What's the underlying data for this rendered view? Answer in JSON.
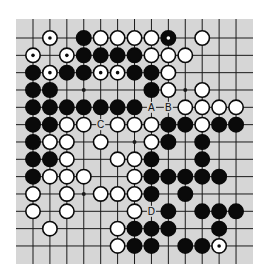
{
  "diagram": {
    "type": "go-board-partial",
    "columns": 13,
    "rows": 13,
    "colors": {
      "board": "#d6d6d6",
      "grid": "#1a1a1a",
      "black_stone": "#0a0a0a",
      "white_stone": "#ffffff",
      "stone_outline": "#0a0a0a"
    },
    "hoshi": [
      {
        "row": 3,
        "col": 3
      },
      {
        "row": 3,
        "col": 9
      },
      {
        "row": 6,
        "col": 6
      },
      {
        "row": 9,
        "col": 3
      }
    ],
    "stones": [
      {
        "row": 0,
        "col": 1,
        "color": "white",
        "marked": true
      },
      {
        "row": 0,
        "col": 3,
        "color": "black"
      },
      {
        "row": 0,
        "col": 4,
        "color": "white"
      },
      {
        "row": 0,
        "col": 5,
        "color": "white"
      },
      {
        "row": 0,
        "col": 6,
        "color": "white"
      },
      {
        "row": 0,
        "col": 7,
        "color": "white"
      },
      {
        "row": 0,
        "col": 8,
        "color": "black",
        "marked": true
      },
      {
        "row": 0,
        "col": 10,
        "color": "white"
      },
      {
        "row": 1,
        "col": 0,
        "color": "white",
        "marked": true
      },
      {
        "row": 1,
        "col": 2,
        "color": "white",
        "marked": true
      },
      {
        "row": 1,
        "col": 3,
        "color": "black"
      },
      {
        "row": 1,
        "col": 4,
        "color": "black"
      },
      {
        "row": 1,
        "col": 5,
        "color": "black"
      },
      {
        "row": 1,
        "col": 6,
        "color": "black"
      },
      {
        "row": 1,
        "col": 7,
        "color": "white"
      },
      {
        "row": 1,
        "col": 8,
        "color": "white"
      },
      {
        "row": 1,
        "col": 9,
        "color": "white"
      },
      {
        "row": 2,
        "col": 0,
        "color": "black"
      },
      {
        "row": 2,
        "col": 1,
        "color": "white",
        "marked": true
      },
      {
        "row": 2,
        "col": 2,
        "color": "black"
      },
      {
        "row": 2,
        "col": 3,
        "color": "black"
      },
      {
        "row": 2,
        "col": 4,
        "color": "white",
        "marked": true
      },
      {
        "row": 2,
        "col": 5,
        "color": "white",
        "marked": true
      },
      {
        "row": 2,
        "col": 6,
        "color": "black"
      },
      {
        "row": 2,
        "col": 7,
        "color": "black"
      },
      {
        "row": 2,
        "col": 8,
        "color": "white"
      },
      {
        "row": 3,
        "col": 0,
        "color": "black"
      },
      {
        "row": 3,
        "col": 1,
        "color": "black"
      },
      {
        "row": 3,
        "col": 7,
        "color": "black"
      },
      {
        "row": 3,
        "col": 8,
        "color": "white"
      },
      {
        "row": 3,
        "col": 10,
        "color": "white"
      },
      {
        "row": 4,
        "col": 0,
        "color": "black"
      },
      {
        "row": 4,
        "col": 1,
        "color": "black"
      },
      {
        "row": 4,
        "col": 2,
        "color": "black"
      },
      {
        "row": 4,
        "col": 3,
        "color": "black"
      },
      {
        "row": 4,
        "col": 4,
        "color": "black"
      },
      {
        "row": 4,
        "col": 5,
        "color": "black"
      },
      {
        "row": 4,
        "col": 6,
        "color": "black"
      },
      {
        "row": 4,
        "col": 9,
        "color": "white"
      },
      {
        "row": 4,
        "col": 10,
        "color": "white"
      },
      {
        "row": 4,
        "col": 11,
        "color": "white"
      },
      {
        "row": 4,
        "col": 12,
        "color": "white"
      },
      {
        "row": 5,
        "col": 0,
        "color": "black"
      },
      {
        "row": 5,
        "col": 1,
        "color": "black"
      },
      {
        "row": 5,
        "col": 2,
        "color": "white"
      },
      {
        "row": 5,
        "col": 3,
        "color": "white"
      },
      {
        "row": 5,
        "col": 5,
        "color": "white"
      },
      {
        "row": 5,
        "col": 6,
        "color": "white"
      },
      {
        "row": 5,
        "col": 7,
        "color": "white"
      },
      {
        "row": 5,
        "col": 8,
        "color": "black"
      },
      {
        "row": 5,
        "col": 9,
        "color": "black"
      },
      {
        "row": 5,
        "col": 10,
        "color": "white"
      },
      {
        "row": 5,
        "col": 11,
        "color": "black"
      },
      {
        "row": 5,
        "col": 12,
        "color": "black"
      },
      {
        "row": 6,
        "col": 0,
        "color": "black"
      },
      {
        "row": 6,
        "col": 1,
        "color": "white"
      },
      {
        "row": 6,
        "col": 2,
        "color": "white"
      },
      {
        "row": 6,
        "col": 4,
        "color": "white"
      },
      {
        "row": 6,
        "col": 7,
        "color": "white"
      },
      {
        "row": 6,
        "col": 8,
        "color": "black"
      },
      {
        "row": 6,
        "col": 10,
        "color": "black"
      },
      {
        "row": 7,
        "col": 0,
        "color": "black"
      },
      {
        "row": 7,
        "col": 1,
        "color": "black"
      },
      {
        "row": 7,
        "col": 2,
        "color": "white"
      },
      {
        "row": 7,
        "col": 5,
        "color": "white"
      },
      {
        "row": 7,
        "col": 6,
        "color": "white"
      },
      {
        "row": 7,
        "col": 7,
        "color": "black"
      },
      {
        "row": 7,
        "col": 10,
        "color": "black"
      },
      {
        "row": 8,
        "col": 0,
        "color": "black"
      },
      {
        "row": 8,
        "col": 1,
        "color": "white"
      },
      {
        "row": 8,
        "col": 2,
        "color": "white"
      },
      {
        "row": 8,
        "col": 3,
        "color": "white"
      },
      {
        "row": 8,
        "col": 6,
        "color": "white"
      },
      {
        "row": 8,
        "col": 7,
        "color": "black"
      },
      {
        "row": 8,
        "col": 8,
        "color": "black"
      },
      {
        "row": 8,
        "col": 9,
        "color": "black"
      },
      {
        "row": 8,
        "col": 10,
        "color": "black"
      },
      {
        "row": 8,
        "col": 11,
        "color": "black"
      },
      {
        "row": 9,
        "col": 0,
        "color": "white"
      },
      {
        "row": 9,
        "col": 2,
        "color": "white"
      },
      {
        "row": 9,
        "col": 4,
        "color": "white"
      },
      {
        "row": 9,
        "col": 5,
        "color": "white"
      },
      {
        "row": 9,
        "col": 6,
        "color": "white"
      },
      {
        "row": 9,
        "col": 7,
        "color": "black"
      },
      {
        "row": 9,
        "col": 9,
        "color": "black"
      },
      {
        "row": 10,
        "col": 0,
        "color": "white"
      },
      {
        "row": 10,
        "col": 2,
        "color": "white"
      },
      {
        "row": 10,
        "col": 6,
        "color": "white"
      },
      {
        "row": 10,
        "col": 8,
        "color": "black"
      },
      {
        "row": 10,
        "col": 10,
        "color": "black"
      },
      {
        "row": 10,
        "col": 11,
        "color": "black"
      },
      {
        "row": 10,
        "col": 12,
        "color": "black"
      },
      {
        "row": 11,
        "col": 1,
        "color": "white"
      },
      {
        "row": 11,
        "col": 5,
        "color": "white"
      },
      {
        "row": 11,
        "col": 6,
        "color": "black"
      },
      {
        "row": 11,
        "col": 7,
        "color": "black"
      },
      {
        "row": 11,
        "col": 8,
        "color": "black"
      },
      {
        "row": 11,
        "col": 11,
        "color": "black"
      },
      {
        "row": 12,
        "col": 5,
        "color": "white"
      },
      {
        "row": 12,
        "col": 6,
        "color": "black"
      },
      {
        "row": 12,
        "col": 7,
        "color": "black"
      },
      {
        "row": 12,
        "col": 9,
        "color": "black"
      },
      {
        "row": 12,
        "col": 10,
        "color": "black"
      },
      {
        "row": 12,
        "col": 11,
        "color": "white",
        "marked": true
      }
    ],
    "labels": [
      {
        "row": 4,
        "col": 7,
        "text": "A"
      },
      {
        "row": 4,
        "col": 8,
        "text": "B"
      },
      {
        "row": 5,
        "col": 4,
        "text": "C"
      },
      {
        "row": 10,
        "col": 7,
        "text": "D"
      }
    ]
  }
}
